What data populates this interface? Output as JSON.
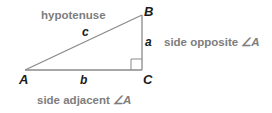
{
  "diagram": {
    "vertices": {
      "A": {
        "label": "A",
        "x": 25,
        "y": 70
      },
      "B": {
        "label": "B",
        "x": 142,
        "y": 15
      },
      "C": {
        "label": "C",
        "x": 142,
        "y": 70
      }
    },
    "sides": {
      "c": {
        "label": "c",
        "from": "A",
        "to": "B"
      },
      "a": {
        "label": "a",
        "from": "B",
        "to": "C"
      },
      "b": {
        "label": "b",
        "from": "A",
        "to": "C"
      }
    },
    "right_angle_at": "C",
    "annotations": {
      "hypotenuse": "hypotenuse",
      "opposite_prefix": "side opposite ",
      "opposite_angle": "∠A",
      "adjacent_prefix": "side adjacent ",
      "adjacent_angle": "∠A"
    },
    "colors": {
      "annotation_text": "#7d7d7d",
      "label_text": "#1a1a1a",
      "edge": "#8a8a8a",
      "background": "#ffffff"
    }
  }
}
